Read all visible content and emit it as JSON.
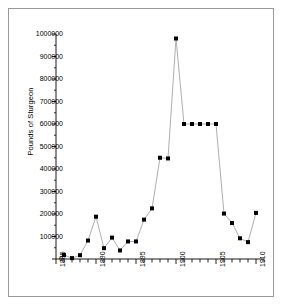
{
  "figure": {
    "background_color": "#ffffff",
    "border_color": "#9a9a9a"
  },
  "chart_data": {
    "type": "line",
    "title": "",
    "subtitle": "",
    "xlabel": "",
    "ylabel": "Pounds of Sturgeon",
    "xlim": [
      1885,
      1911
    ],
    "ylim": [
      0,
      1000000
    ],
    "grid": false,
    "legend": null,
    "marker": "square",
    "marker_color": "#000000",
    "line_color": "#999999",
    "x_tick_labels": [
      "1885",
      "1890",
      "1895",
      "1900",
      "1905",
      "1910"
    ],
    "x_tick_values": [
      1885,
      1890,
      1895,
      1900,
      1905,
      1910
    ],
    "x_minor_tick_step": 1,
    "y_tick_labels": [
      "0",
      "100000",
      "200000",
      "300000",
      "400000",
      "500000",
      "600000",
      "700000",
      "800000",
      "900000",
      "1000000"
    ],
    "y_tick_values": [
      0,
      100000,
      200000,
      300000,
      400000,
      500000,
      600000,
      700000,
      800000,
      900000,
      1000000
    ],
    "x": [
      1886,
      1887,
      1888,
      1889,
      1890,
      1891,
      1892,
      1893,
      1894,
      1895,
      1896,
      1897,
      1898,
      1899,
      1900,
      1901,
      1902,
      1903,
      1904,
      1905,
      1906,
      1907,
      1908,
      1909,
      1910
    ],
    "values": [
      18000,
      4000,
      17000,
      82000,
      188000,
      48000,
      95000,
      38000,
      78000,
      78000,
      175000,
      225000,
      450000,
      447000,
      980000,
      600000,
      600000,
      600000,
      600000,
      600000,
      202000,
      160000,
      92000,
      75000,
      205000
    ],
    "series": [
      {
        "name": "Pounds of Sturgeon",
        "values": [
          18000,
          4000,
          17000,
          82000,
          188000,
          48000,
          95000,
          38000,
          78000,
          78000,
          175000,
          225000,
          450000,
          447000,
          980000,
          600000,
          600000,
          600000,
          600000,
          600000,
          202000,
          160000,
          92000,
          75000,
          205000
        ]
      }
    ]
  }
}
